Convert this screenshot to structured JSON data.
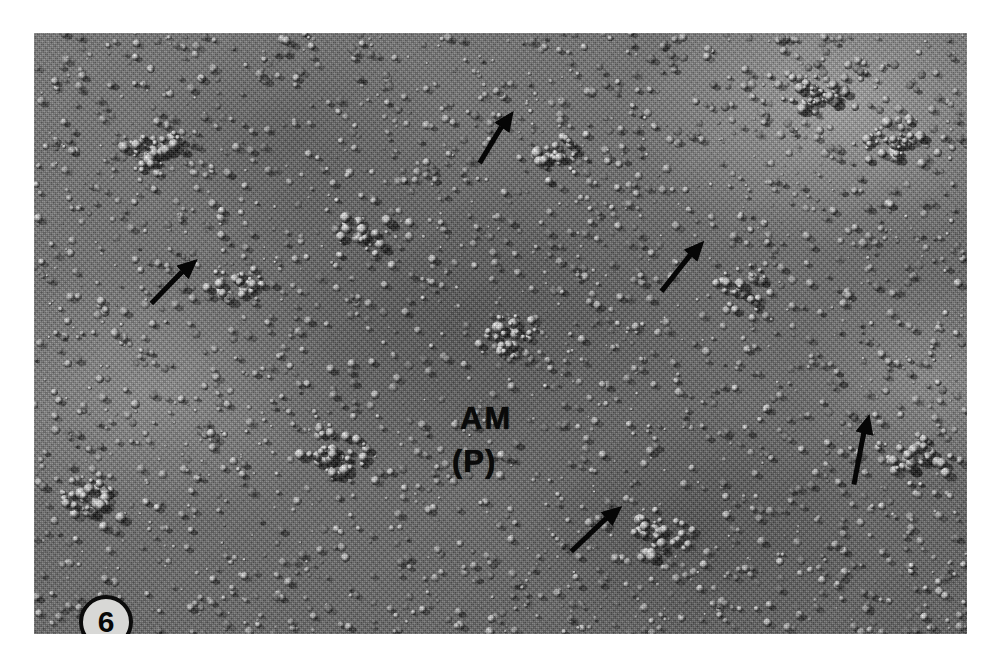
{
  "figure": {
    "number": "6",
    "kind": "freeze-fracture-electron-micrograph",
    "caption_labels": {
      "membrane_label": "AM",
      "fracture_face_label": "(P)"
    },
    "scale_bar": {
      "present": true,
      "length_px": 98,
      "text": ""
    }
  },
  "image": {
    "alt": "freeze-fracture replica of an apical membrane P-face densely studded with intramembrane particles",
    "plate": {
      "left": 34,
      "top": 33,
      "width": 933,
      "height": 601
    },
    "background_hex": "#6e6e6e",
    "ink_hex": "#0a0a0a",
    "badge_fill_hex": "#d8d8d6"
  },
  "annotations": {
    "arrows": [
      {
        "name": "arrow-upper-left",
        "x": 150,
        "y": 290,
        "angle": -42,
        "length": 64
      },
      {
        "name": "arrow-top-center",
        "x": 478,
        "y": 150,
        "angle": -55,
        "length": 62
      },
      {
        "name": "arrow-middle-right",
        "x": 660,
        "y": 278,
        "angle": -48,
        "length": 66
      },
      {
        "name": "arrow-bottom-center",
        "x": 570,
        "y": 538,
        "angle": -40,
        "length": 68
      },
      {
        "name": "arrow-right-lower",
        "x": 852,
        "y": 472,
        "angle": -76,
        "length": 72
      }
    ],
    "arrow_count": 5,
    "arrow_color_hex": "#060606"
  }
}
